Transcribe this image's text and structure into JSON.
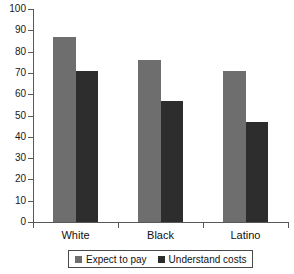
{
  "chart_data": {
    "type": "bar",
    "title": "",
    "subtitle": "",
    "xlabel": "",
    "ylabel": "",
    "categories": [
      "White",
      "Black",
      "Latino"
    ],
    "series": [
      {
        "name": "Expect to pay",
        "values": [
          87,
          76,
          71
        ],
        "color": "#6e6e6e"
      },
      {
        "name": "Understand costs",
        "values": [
          71,
          57,
          47
        ],
        "color": "#2d2d2d"
      }
    ],
    "ylim": [
      0,
      100
    ],
    "ytick_labels": [
      "0",
      "10",
      "20",
      "30",
      "40",
      "50",
      "60",
      "70",
      "80",
      "90",
      "100"
    ],
    "ytick_values": [
      0,
      10,
      20,
      30,
      40,
      50,
      60,
      70,
      80,
      90,
      100
    ],
    "grid": false,
    "legend_position": "bottom",
    "axis_color": "#585858",
    "background": "#ffffff"
  },
  "legend": {
    "entries": [
      {
        "label": "Expect to pay",
        "swatch": "legend-swatch-expect-to-pay"
      },
      {
        "label": "Understand costs",
        "swatch": "legend-swatch-understand-costs"
      }
    ]
  }
}
